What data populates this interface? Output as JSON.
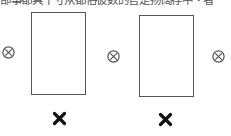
{
  "caption": {
    "text": "部事都具十寸从都俗彼数的官是扬阔存中・者",
    "cropped": true
  },
  "diagram": {
    "rectangles": [
      {
        "name": "left-rectangle",
        "x": 31,
        "y": 12,
        "w": 55,
        "h": 83
      },
      {
        "name": "right-rectangle",
        "x": 139,
        "y": 15,
        "w": 55,
        "h": 82
      }
    ],
    "field_into_page_symbols": [
      {
        "name": "left",
        "cx": 8,
        "cy": 52
      },
      {
        "name": "middle",
        "cx": 113,
        "cy": 56
      },
      {
        "name": "right",
        "cx": 218,
        "cy": 56
      }
    ],
    "bold_cross_marks": [
      {
        "name": "left",
        "cx": 59,
        "cy": 118
      },
      {
        "name": "right",
        "cx": 165,
        "cy": 119
      }
    ],
    "colors": {
      "stroke": "#555555",
      "mark": "#111111",
      "background": "#ffffff"
    },
    "icons": {
      "otimes": "circled-x-icon",
      "cross": "bold-x-icon"
    }
  }
}
